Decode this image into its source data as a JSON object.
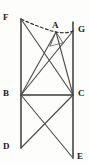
{
  "figure": {
    "type": "geometry-diagram",
    "width": 89,
    "height": 164,
    "background_color": "#fdfdfc",
    "stroke_color": "#3a3a3a",
    "label_color": "#1a1a1a",
    "points": {
      "F": {
        "x": 21,
        "y": 19,
        "label": "F",
        "label_x": 4,
        "label_y": 14
      },
      "A": {
        "x": 56,
        "y": 32,
        "label": "A",
        "label_x": 52,
        "label_y": 22
      },
      "G": {
        "x": 73,
        "y": 31,
        "label": "G",
        "label_x": 77,
        "label_y": 26
      },
      "B": {
        "x": 21,
        "y": 95,
        "label": "B",
        "label_x": 4,
        "label_y": 90
      },
      "C": {
        "x": 73,
        "y": 95,
        "label": "C",
        "label_x": 77,
        "label_y": 90
      },
      "D": {
        "x": 21,
        "y": 148,
        "label": "D",
        "label_x": 4,
        "label_y": 143
      },
      "E": {
        "x": 73,
        "y": 158,
        "label": "E",
        "label_x": 77,
        "label_y": 152
      }
    },
    "segments": [
      {
        "name": "left-vertical-F-D",
        "from": "F",
        "to": "D",
        "style": "solid"
      },
      {
        "name": "right-vertical-G-E",
        "from": "G",
        "to": "E",
        "style": "solid"
      },
      {
        "name": "base-B-C",
        "from": "B",
        "to": "C",
        "style": "solid"
      },
      {
        "name": "diagonal-F-C",
        "from": "F",
        "to": "C",
        "style": "solid"
      },
      {
        "name": "diagonal-B-G",
        "from": "B",
        "to": "G",
        "style": "solid"
      },
      {
        "name": "diagonal-B-A",
        "from": "B",
        "to": "A",
        "style": "solid"
      },
      {
        "name": "diagonal-A-C",
        "from": "A",
        "to": "C",
        "style": "solid"
      },
      {
        "name": "diagonal-B-E",
        "from": "B",
        "to": "E",
        "style": "solid"
      },
      {
        "name": "diagonal-C-D",
        "from": "C",
        "to": "D",
        "style": "solid"
      },
      {
        "name": "dashed-arc-F-A-G",
        "from": "F",
        "to": "G",
        "via": "A",
        "style": "dashed"
      }
    ],
    "small_triangle": {
      "name": "apex-triangle-under-A",
      "apex_x": 56,
      "apex_y": 32,
      "left_x": 50,
      "left_y": 46,
      "right_x": 63,
      "right_y": 43
    }
  }
}
